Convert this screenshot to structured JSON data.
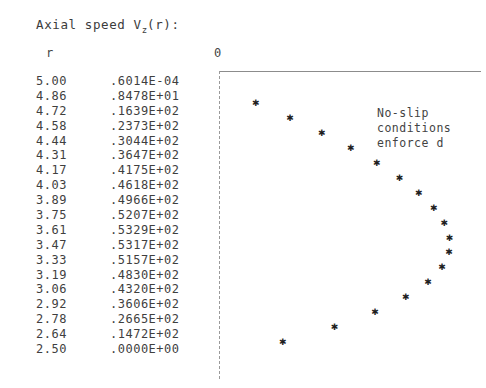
{
  "title": {
    "prefix": "Axial speed V",
    "subscript": "z",
    "suffix": "(r):"
  },
  "headers": {
    "r_label": "r",
    "zero_label": "0"
  },
  "annotation": {
    "line1": "No-slip",
    "line2": "conditions",
    "line3": "enforce d"
  },
  "table": {
    "columns": [
      "r",
      "Vz(r)"
    ],
    "rows": [
      {
        "r": "5.00",
        "v": ".6014E-04"
      },
      {
        "r": "4.86",
        "v": ".8478E+01"
      },
      {
        "r": "4.72",
        "v": ".1639E+02"
      },
      {
        "r": "4.58",
        "v": ".2373E+02"
      },
      {
        "r": "4.44",
        "v": ".3044E+02"
      },
      {
        "r": "4.31",
        "v": ".3647E+02"
      },
      {
        "r": "4.17",
        "v": ".4175E+02"
      },
      {
        "r": "4.03",
        "v": ".4618E+02"
      },
      {
        "r": "3.89",
        "v": ".4966E+02"
      },
      {
        "r": "3.75",
        "v": ".5207E+02"
      },
      {
        "r": "3.61",
        "v": ".5329E+02"
      },
      {
        "r": "3.47",
        "v": ".5317E+02"
      },
      {
        "r": "3.33",
        "v": ".5157E+02"
      },
      {
        "r": "3.19",
        "v": ".4830E+02"
      },
      {
        "r": "3.06",
        "v": ".4320E+02"
      },
      {
        "r": "2.92",
        "v": ".3606E+02"
      },
      {
        "r": "2.78",
        "v": ".2665E+02"
      },
      {
        "r": "2.64",
        "v": ".1472E+02"
      },
      {
        "r": "2.50",
        "v": ".0000E+00"
      }
    ]
  },
  "chart_data": {
    "type": "scatter",
    "title": "Axial speed Vz(r):",
    "xlabel": "",
    "ylabel": "r",
    "x": [
      0.006014,
      8.478,
      16.39,
      23.73,
      30.44,
      36.47,
      41.75,
      46.18,
      49.66,
      52.07,
      53.29,
      53.17,
      51.57,
      48.3,
      43.2,
      36.06,
      26.65,
      14.72,
      0.0
    ],
    "y": [
      5.0,
      4.86,
      4.72,
      4.58,
      4.44,
      4.31,
      4.17,
      4.03,
      3.89,
      3.75,
      3.61,
      3.47,
      3.33,
      3.19,
      3.06,
      2.92,
      2.78,
      2.64,
      2.5
    ],
    "xlim": [
      0,
      60
    ],
    "ylim": [
      2.5,
      5.0
    ],
    "xticks": [
      "0"
    ],
    "grid": false,
    "legend": null,
    "marker": "asterisk",
    "annotations": [
      "No-slip",
      "conditions",
      "enforce d"
    ]
  },
  "plot_geometry": {
    "x_origin_px": 0,
    "px_per_unit": 4.32,
    "row_spacing_px": 14.9,
    "first_row_y_px": 17
  }
}
